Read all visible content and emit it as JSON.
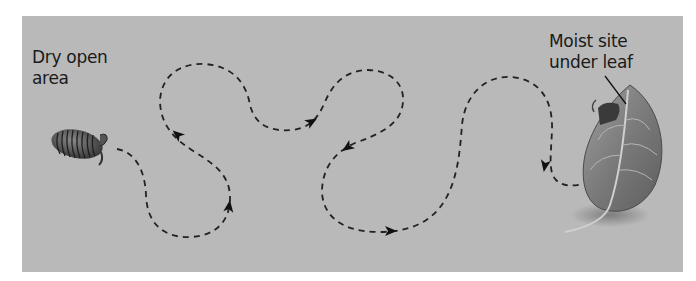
{
  "diagram": {
    "type": "movement-path-illustration",
    "labels": {
      "start_line1": "Dry open",
      "start_line2": "area",
      "end_line1": "Moist site",
      "end_line2": "under leaf"
    },
    "elements": {
      "organism": "pill-bug",
      "destination": "leaf",
      "path_style": "dashed",
      "arrow_count": 7
    },
    "colors": {
      "background": "#b9b9b9",
      "path": "#1a1a1a",
      "leaf": "#8a8a8a",
      "text": "#1a1a1a"
    }
  }
}
